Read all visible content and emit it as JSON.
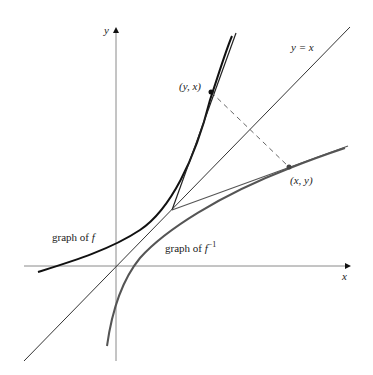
{
  "figure": {
    "axes": {
      "x_label": "x",
      "y_label": "y",
      "origin_px": [
        116,
        266
      ],
      "color": "#888888"
    },
    "identity_line": {
      "label": "y = x",
      "color": "#333333"
    },
    "curves": {
      "f": {
        "label_prefix": "graph of ",
        "label_func": "f",
        "color": "#111111"
      },
      "f_inverse": {
        "label_prefix": "graph of ",
        "label_func": "f",
        "label_sup": "−1",
        "color": "#555555"
      }
    },
    "points": {
      "on_f": {
        "label": "(y, x)",
        "px": [
          211,
          92
        ]
      },
      "on_f_inverse": {
        "label": "(x, y)",
        "px": [
          289,
          167
        ]
      },
      "tangent_intersection_px": [
        172,
        210
      ]
    },
    "tangents": {
      "tangent_to_f_color": "#222222",
      "tangent_to_f_inverse_color": "#555555"
    },
    "reflection_segment": {
      "style": "dashed",
      "color": "#666666"
    }
  }
}
